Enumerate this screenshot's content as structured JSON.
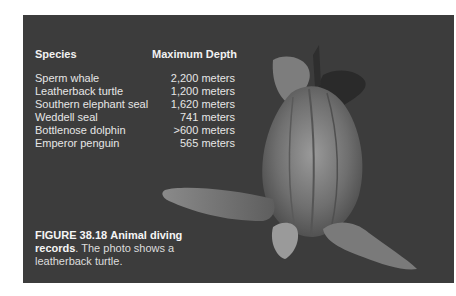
{
  "table": {
    "headers": {
      "species": "Species",
      "depth": "Maximum Depth"
    },
    "rows": [
      {
        "species": "Sperm whale",
        "depth": "2,200 meters"
      },
      {
        "species": "Leatherback turtle",
        "depth": "1,200 meters"
      },
      {
        "species": "Southern elephant seal",
        "depth": "1,620 meters"
      },
      {
        "species": "Weddell seal",
        "depth": "741 meters"
      },
      {
        "species": "Bottlenose dolphin",
        "depth": ">600 meters"
      },
      {
        "species": "Emperor penguin",
        "depth": "565 meters"
      }
    ]
  },
  "caption": {
    "figure_label": "FIGURE 38.18",
    "title": "Animal diving records",
    "body": ". The photo shows a leatherback turtle."
  },
  "photo": {
    "subject": "leatherback-turtle"
  }
}
